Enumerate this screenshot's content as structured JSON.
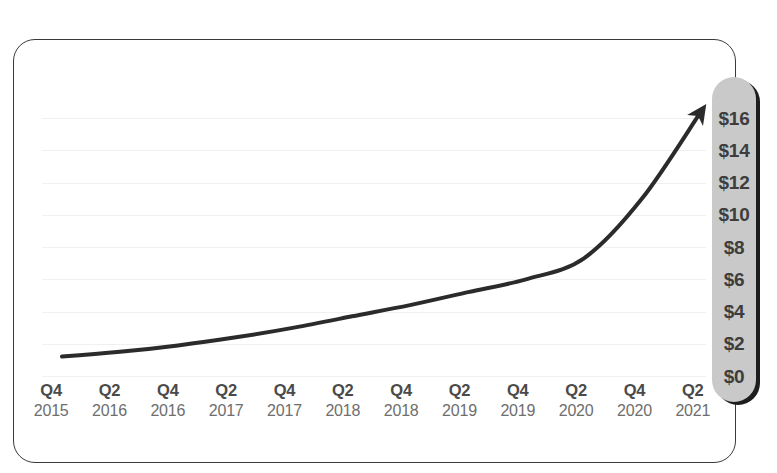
{
  "chart_data": {
    "type": "line",
    "title": "",
    "subtitle": "",
    "xlabel": "",
    "ylabel": "",
    "grid": true,
    "legend": false,
    "ylim": [
      0,
      17
    ],
    "ytick_labels": [
      "$16",
      "$14",
      "$12",
      "$10",
      "$8",
      "$6",
      "$4",
      "$2",
      "$0"
    ],
    "ytick_values": [
      16,
      14,
      12,
      10,
      8,
      6,
      4,
      2,
      0
    ],
    "categories": [
      "Q4 2015",
      "Q2 2016",
      "Q4 2016",
      "Q2 2017",
      "Q4 2017",
      "Q2 2018",
      "Q4 2018",
      "Q2 2019",
      "Q4 2019",
      "Q2 2020",
      "Q4 2020",
      "Q2 2021"
    ],
    "x_quarters": [
      "Q4",
      "Q2",
      "Q4",
      "Q2",
      "Q4",
      "Q2",
      "Q4",
      "Q2",
      "Q4",
      "Q2",
      "Q4",
      "Q2"
    ],
    "x_years": [
      "2015",
      "2016",
      "2016",
      "2017",
      "2017",
      "2018",
      "2018",
      "2019",
      "2019",
      "2020",
      "2020",
      "2021"
    ],
    "series": [
      {
        "name": "Value",
        "values": [
          1.2,
          1.5,
          1.9,
          2.4,
          3.0,
          3.7,
          4.4,
          5.2,
          6.0,
          7.3,
          11.0,
          16.3
        ],
        "color": "#2b2b2b",
        "line_width": 4,
        "arrow_end": true
      }
    ],
    "annotations": [
      {
        "name": "trend-arrowhead",
        "position": "line-end-top-right"
      }
    ]
  },
  "axis": {
    "y_axis_name": "dollar-value-axis",
    "x_axis_name": "quarter-year-axis"
  },
  "colors": {
    "line": "#2b2b2b",
    "gridline": "#f0f0f0",
    "axis_pill_fill": "#c9c9c9",
    "axis_pill_shadow": "#1d1d1d",
    "axis_text": "#3d3d3d",
    "quarter_text": "#4a4a4a",
    "year_text": "#6e6e6e",
    "card_border": "#3a3a3a",
    "background": "#ffffff"
  }
}
